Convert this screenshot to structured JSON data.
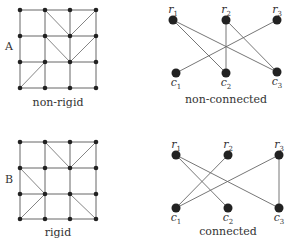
{
  "colors": {
    "edge": "#666666",
    "node": "#222222",
    "text": "#333333"
  },
  "panels": [
    {
      "row_label": "A",
      "grid": {
        "caption": "non-rigid",
        "xs": [
          20,
          45,
          70,
          96
        ],
        "ys": [
          10,
          36,
          62,
          88
        ],
        "diagonals": [
          [
            [
              45,
              10
            ],
            [
              70,
              36
            ]
          ],
          [
            [
              96,
              10
            ],
            [
              70,
              36
            ]
          ],
          [
            [
              45,
              36
            ],
            [
              70,
              62
            ]
          ],
          [
            [
              96,
              36
            ],
            [
              70,
              62
            ]
          ],
          [
            [
              20,
              88
            ],
            [
              45,
              62
            ]
          ]
        ]
      },
      "bipartite": {
        "caption": "non-connected",
        "rows": [
          {
            "name": "r",
            "sub": "1",
            "x": 173,
            "y": 20
          },
          {
            "name": "r",
            "sub": "2",
            "x": 226,
            "y": 20
          },
          {
            "name": "r",
            "sub": "3",
            "x": 277,
            "y": 20
          }
        ],
        "cols": [
          {
            "name": "c",
            "sub": "1",
            "x": 176,
            "y": 73
          },
          {
            "name": "c",
            "sub": "2",
            "x": 226,
            "y": 73
          },
          {
            "name": "c",
            "sub": "3",
            "x": 277,
            "y": 72
          }
        ],
        "edges": [
          [
            0,
            1
          ],
          [
            0,
            2
          ],
          [
            1,
            1
          ],
          [
            1,
            2
          ],
          [
            2,
            0
          ]
        ]
      }
    },
    {
      "row_label": "B",
      "grid": {
        "caption": "rigid",
        "xs": [
          20,
          45,
          70,
          96
        ],
        "ys": [
          142,
          168,
          194,
          219
        ],
        "diagonals": [
          [
            [
              45,
              142
            ],
            [
              70,
              168
            ]
          ],
          [
            [
              96,
              142
            ],
            [
              70,
              168
            ]
          ],
          [
            [
              20,
              168
            ],
            [
              45,
              194
            ]
          ],
          [
            [
              45,
              194
            ],
            [
              20,
              219
            ]
          ],
          [
            [
              70,
              194
            ],
            [
              96,
              219
            ]
          ]
        ]
      },
      "bipartite": {
        "caption": "connected",
        "rows": [
          {
            "name": "r",
            "sub": "1",
            "x": 176,
            "y": 155
          },
          {
            "name": "r",
            "sub": "2",
            "x": 228,
            "y": 155
          },
          {
            "name": "r",
            "sub": "3",
            "x": 279,
            "y": 155
          }
        ],
        "cols": [
          {
            "name": "c",
            "sub": "1",
            "x": 176,
            "y": 208
          },
          {
            "name": "c",
            "sub": "2",
            "x": 228,
            "y": 208
          },
          {
            "name": "c",
            "sub": "3",
            "x": 279,
            "y": 208
          }
        ],
        "edges": [
          [
            0,
            1
          ],
          [
            0,
            2
          ],
          [
            1,
            0
          ],
          [
            2,
            0
          ],
          [
            2,
            2
          ]
        ]
      }
    }
  ],
  "layout": {
    "row_label_pos": [
      {
        "x": 5,
        "y": 40
      },
      {
        "x": 5,
        "y": 173
      }
    ],
    "grid_caption_pos": [
      {
        "x": 58,
        "y": 96
      },
      {
        "x": 58,
        "y": 226
      }
    ],
    "bip_caption_pos": [
      {
        "x": 226,
        "y": 93
      },
      {
        "x": 228,
        "y": 225
      }
    ]
  }
}
